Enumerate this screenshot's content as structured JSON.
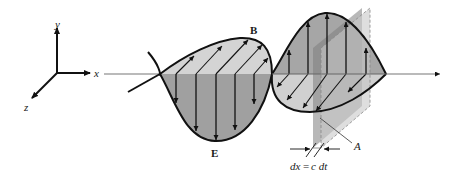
{
  "figure": {
    "axes": {
      "x_label": "x",
      "y_label": "y",
      "z_label": "z"
    },
    "fields": {
      "magnetic_label": "B",
      "electric_label": "E"
    },
    "plane": {
      "label": "A"
    },
    "thickness": {
      "label_lhs": "dx",
      "equals": "=",
      "label_rhs": "c dt"
    },
    "colors": {
      "outline": "#111111",
      "lobe_light": "#d4d4d4",
      "lobe_dark": "#9a9a9a",
      "plane_dark": "#7d7d7d",
      "plane_light": "#c8c8c8",
      "axis_gray": "#777777"
    }
  }
}
